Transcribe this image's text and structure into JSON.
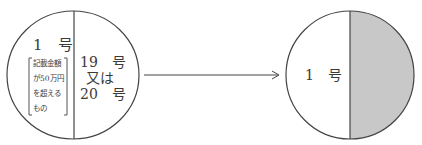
{
  "diagram": {
    "left_circle": {
      "left_section": {
        "label": "1　号",
        "bracket_lines": [
          "記載金額",
          "が50万円",
          "を超える",
          "もの"
        ]
      },
      "right_section": {
        "line1": "19　号",
        "line2": "又は",
        "line3": "20　号"
      }
    },
    "arrow": {
      "direction": "right"
    },
    "right_circle": {
      "left_section": {
        "label": "1　号"
      },
      "right_section": {
        "shaded": true,
        "fill": "#c8c8c8"
      }
    },
    "colors": {
      "line": "#444444",
      "shade": "#c8c8c8"
    }
  }
}
